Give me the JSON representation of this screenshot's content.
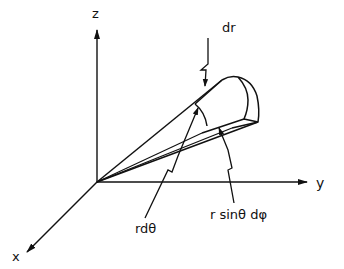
{
  "diagram": {
    "title": "",
    "axes": {
      "z": {
        "label": "z"
      },
      "y": {
        "label": "y"
      },
      "x": {
        "label": "x"
      }
    },
    "annotations": {
      "dr": "dr",
      "r_dtheta": "rdθ",
      "r_sintheta_dphi": "r sinθ dφ"
    },
    "colors": {
      "ink": "#111111",
      "background": "#ffffff"
    }
  }
}
